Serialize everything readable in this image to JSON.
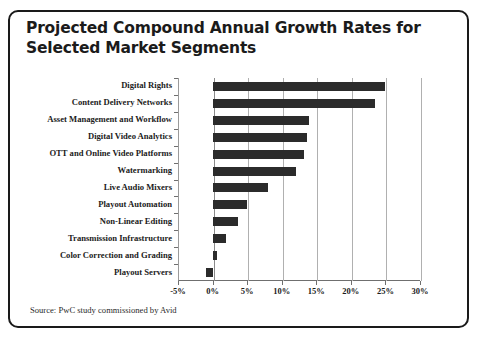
{
  "figure": {
    "title_lines": [
      "Projected Compound Annual Growth Rates for",
      "Selected Market Segments"
    ],
    "source_note": "Source: PwC study commissioned by Avid",
    "colors": {
      "bar": "#2b2b2b",
      "frame": "#1a1a1a",
      "grid": "#b0b0b0",
      "axis": "#6f6f6f",
      "background": "#ffffff",
      "text": "#1b1b1b"
    }
  },
  "chart_data": {
    "type": "bar",
    "orientation": "horizontal",
    "title": "Projected Compound Annual Growth Rates for Selected Market Segments",
    "xlabel": "",
    "ylabel": "",
    "xlim": [
      -5,
      30
    ],
    "xticks": [
      -5,
      0,
      5,
      10,
      15,
      20,
      25,
      30
    ],
    "xtick_labels": [
      "-5%",
      "0%",
      "5%",
      "10%",
      "15%",
      "20%",
      "25%",
      "30%"
    ],
    "grid": true,
    "legend": false,
    "units": "percent",
    "categories": [
      "Digital Rights",
      "Content Delivery Networks",
      "Asset Management and Workflow",
      "Digital Video Analytics",
      "OTT and Online Video Platforms",
      "Watermarking",
      "Live Audio Mixers",
      "Playout Automation",
      "Non-Linear Editing",
      "Transmission Infrastructure",
      "Color Correction and Grading",
      "Playout Servers"
    ],
    "values": [
      25.0,
      23.5,
      14.0,
      13.6,
      13.2,
      12.0,
      8.0,
      5.0,
      3.7,
      2.0,
      0.7,
      -1.0
    ]
  }
}
